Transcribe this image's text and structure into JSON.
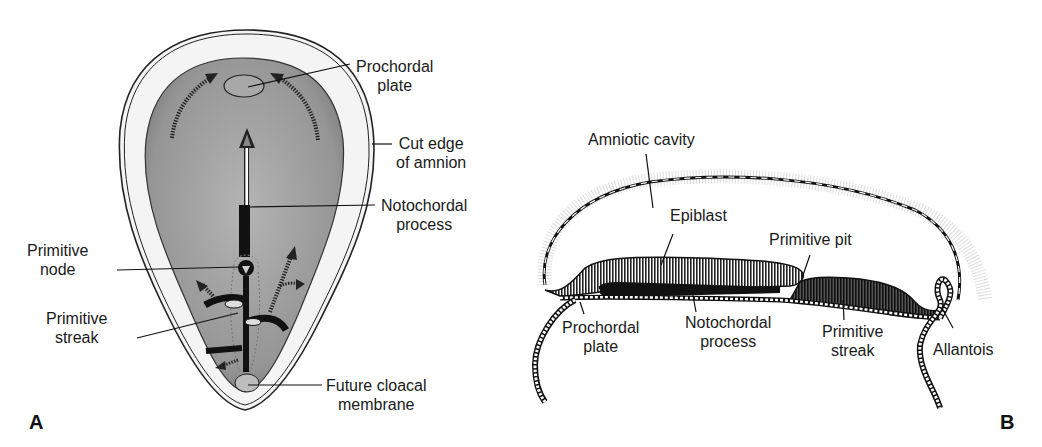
{
  "figure": {
    "panels": [
      {
        "id": "A",
        "letter": "A",
        "view": "dorsal view of embryonic disc",
        "labels": {
          "prochordal_plate": [
            "Prochordal",
            "plate"
          ],
          "cut_edge_amnion": [
            "Cut edge",
            "of amnion"
          ],
          "notochordal_process": [
            "Notochordal",
            "process"
          ],
          "primitive_node": [
            "Primitive",
            "node"
          ],
          "primitive_streak": [
            "Primitive",
            "streak"
          ],
          "future_cloacal_membrane": [
            "Future cloacal",
            "membrane"
          ]
        }
      },
      {
        "id": "B",
        "letter": "B",
        "view": "sagittal section",
        "labels": {
          "amniotic_cavity": "Amniotic cavity",
          "epiblast": "Epiblast",
          "primitive_pit": "Primitive pit",
          "prochordal_plate": [
            "Prochordal",
            "plate"
          ],
          "notochordal_process": [
            "Notochordal",
            "process"
          ],
          "primitive_streak": [
            "Primitive",
            "streak"
          ],
          "allantois": "Allantois"
        }
      }
    ],
    "colors": {
      "ink": "#1a1a1a",
      "disc_fill": "#9a9a9a",
      "amnion_fill": "#f2f2f2",
      "background": "#ffffff"
    }
  }
}
